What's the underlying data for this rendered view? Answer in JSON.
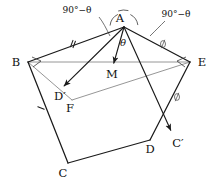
{
  "diagram": {
    "type": "geometry-figure",
    "canvas": {
      "width": 216,
      "height": 183,
      "background": "#ffffff"
    },
    "colors": {
      "edge": "#1a1a1a",
      "auxiliary": "#8a8a8a",
      "vector": "#1a1a1a",
      "label": "#111111",
      "mark": "#3a3a3a"
    },
    "vertices": [
      {
        "id": "A",
        "label": "A",
        "x": 124,
        "y": 27,
        "label_x": 120,
        "label_y": 22,
        "anchor": "middle"
      },
      {
        "id": "B",
        "label": "B",
        "x": 28,
        "y": 62,
        "label_x": 16,
        "label_y": 66,
        "anchor": "middle"
      },
      {
        "id": "C",
        "label": "C",
        "x": 68,
        "y": 163,
        "label_x": 63,
        "label_y": 177,
        "anchor": "middle"
      },
      {
        "id": "D",
        "label": "D",
        "x": 150,
        "y": 140,
        "label_x": 150,
        "label_y": 153,
        "anchor": "middle"
      },
      {
        "id": "E",
        "label": "E",
        "x": 190,
        "y": 62,
        "label_x": 202,
        "label_y": 66,
        "anchor": "middle"
      },
      {
        "id": "Dp",
        "label": "D′",
        "x": 62,
        "y": 88,
        "label_x": 60,
        "label_y": 100,
        "anchor": "middle"
      },
      {
        "id": "Cp",
        "label": "C′",
        "x": 172,
        "y": 133,
        "label_x": 178,
        "label_y": 147,
        "anchor": "middle"
      },
      {
        "id": "M",
        "label": "M",
        "x": 113,
        "y": 66,
        "label_x": 112,
        "label_y": 78,
        "anchor": "middle"
      },
      {
        "id": "F",
        "label": "F",
        "x": 72,
        "y": 100,
        "label_x": 70,
        "label_y": 112,
        "anchor": "middle"
      }
    ],
    "polygon_edges": [
      {
        "name": "edge-A-B",
        "from": "A",
        "to": "B"
      },
      {
        "name": "edge-B-C",
        "from": "B",
        "to": "C"
      },
      {
        "name": "edge-C-D",
        "from": "C",
        "to": "D"
      },
      {
        "name": "edge-D-E",
        "from": "D",
        "to": "E"
      },
      {
        "name": "edge-E-A",
        "from": "E",
        "to": "A"
      }
    ],
    "auxiliary_edges": [
      {
        "name": "line-B-E",
        "from": "B",
        "to": "E"
      },
      {
        "name": "line-B-F",
        "from": "B",
        "to": "F"
      },
      {
        "name": "line-F-E",
        "from": "F",
        "to": "E"
      }
    ],
    "vectors": [
      {
        "name": "vector-A-to-Dprime",
        "from": "A",
        "to": "Dp"
      },
      {
        "name": "vector-A-to-M",
        "from": "A",
        "to": "M"
      },
      {
        "name": "vector-A-to-Cprime",
        "from": "A",
        "to": "Cp"
      }
    ],
    "tick_marks": [
      {
        "name": "tick-on-AB",
        "x": 73,
        "y": 44,
        "angle": 20,
        "count": 2
      },
      {
        "name": "tick-on-BC",
        "x": 41,
        "y": 108,
        "angle": 112,
        "count": 1
      }
    ],
    "phi_marks": [
      {
        "name": "phi-mark-on-AE",
        "x": 163,
        "y": 44
      },
      {
        "name": "phi-mark-on-ACprime",
        "x": 177,
        "y": 97
      }
    ],
    "angle_arcs": [
      {
        "name": "arc-left-at-A",
        "cx": 124,
        "cy": 27,
        "r": 14,
        "start": 186,
        "end": 244
      },
      {
        "name": "arc-theta-at-A",
        "cx": 124,
        "cy": 27,
        "r": 17,
        "start": 250,
        "end": 285
      },
      {
        "name": "arc-right-at-A",
        "cx": 124,
        "cy": 27,
        "r": 14,
        "start": 297,
        "end": 352
      }
    ],
    "vertex_wedges": [
      {
        "name": "wedge-at-B",
        "x": 28,
        "y": 62,
        "flip": false
      },
      {
        "name": "wedge-at-E",
        "x": 190,
        "y": 62,
        "flip": true
      }
    ],
    "labels": {
      "angle_left": {
        "text": "90°−θ",
        "x": 77,
        "y": 13
      },
      "angle_right": {
        "text": "90°−θ",
        "x": 176,
        "y": 17
      },
      "theta": {
        "text": "θ",
        "x": 123,
        "y": 46
      }
    },
    "leaders": [
      {
        "name": "leader-left-angle",
        "path": "M 99 17 C 103 22, 106 28, 110 36"
      },
      {
        "name": "leader-right-angle",
        "path": "M 165 21 C 160 26, 156 30, 150 36"
      }
    ]
  }
}
